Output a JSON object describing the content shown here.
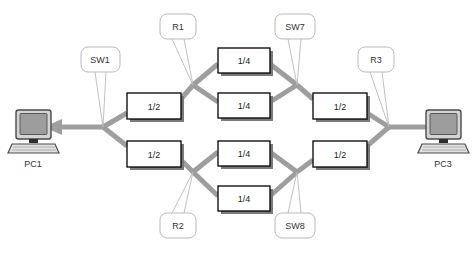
{
  "diagram": {
    "background_color": "#ffffff",
    "link_color": "#9e9e9e",
    "box_border_color": "#000000",
    "box_fill_color": "#ffffff",
    "box_shadow_color": "#7a7a7a",
    "callout_border_color": "#b9b9b9",
    "callout_fill_color": "#ffffff",
    "text_color": "#1a1a1a",
    "endpoints": [
      {
        "id": "pc1",
        "label": "PC1",
        "icon": "desktop-computer-icon",
        "x": 33,
        "y": 127
      },
      {
        "id": "pc3",
        "label": "PC3",
        "icon": "desktop-computer-icon",
        "x": 443,
        "y": 127
      }
    ],
    "boxes": [
      {
        "id": "box-sw1-top",
        "label": "1/2",
        "x": 127,
        "y": 93,
        "w": 54,
        "h": 26
      },
      {
        "id": "box-sw1-bottom",
        "label": "1/2",
        "x": 127,
        "y": 141,
        "w": 54,
        "h": 26
      },
      {
        "id": "box-r1-top",
        "label": "1/4",
        "x": 218,
        "y": 48,
        "w": 52,
        "h": 25
      },
      {
        "id": "box-r1-bottom",
        "label": "1/4",
        "x": 218,
        "y": 93,
        "w": 52,
        "h": 25
      },
      {
        "id": "box-r2-top",
        "label": "1/4",
        "x": 218,
        "y": 141,
        "w": 52,
        "h": 25
      },
      {
        "id": "box-r2-bottom",
        "label": "1/4",
        "x": 218,
        "y": 186,
        "w": 52,
        "h": 25
      },
      {
        "id": "box-sw7",
        "label": "1/2",
        "x": 313,
        "y": 93,
        "w": 54,
        "h": 26
      },
      {
        "id": "box-sw8",
        "label": "1/2",
        "x": 313,
        "y": 141,
        "w": 54,
        "h": 26
      }
    ],
    "callouts": [
      {
        "id": "callout-sw1",
        "label": "SW1",
        "x": 81,
        "y": 47,
        "w": 39,
        "h": 25,
        "tail_from_x": 100,
        "tail_from_y": 72,
        "tail_to_x": 103,
        "tail_to_y": 127
      },
      {
        "id": "callout-r1",
        "label": "R1",
        "x": 160,
        "y": 14,
        "w": 36,
        "h": 25,
        "tail_from_x": 178,
        "tail_from_y": 39,
        "tail_to_x": 193,
        "tail_to_y": 85
      },
      {
        "id": "callout-sw7",
        "label": "SW7",
        "x": 275,
        "y": 14,
        "w": 40,
        "h": 25,
        "tail_from_x": 295,
        "tail_from_y": 39,
        "tail_to_x": 297,
        "tail_to_y": 85
      },
      {
        "id": "callout-r3",
        "label": "R3",
        "x": 358,
        "y": 47,
        "w": 36,
        "h": 25,
        "tail_from_x": 376,
        "tail_from_y": 72,
        "tail_to_x": 389,
        "tail_to_y": 127
      },
      {
        "id": "callout-r2",
        "label": "R2",
        "x": 160,
        "y": 213,
        "w": 36,
        "h": 25,
        "tail_from_x": 178,
        "tail_from_y": 213,
        "tail_to_x": 193,
        "tail_to_y": 172
      },
      {
        "id": "callout-sw8",
        "label": "SW8",
        "x": 275,
        "y": 213,
        "w": 40,
        "h": 25,
        "tail_from_x": 295,
        "tail_from_y": 213,
        "tail_to_x": 297,
        "tail_to_y": 172
      }
    ],
    "junctions": [
      {
        "id": "junction-left",
        "x": 103,
        "y": 127
      },
      {
        "id": "junction-r1",
        "x": 193,
        "y": 85
      },
      {
        "id": "junction-sw7",
        "x": 297,
        "y": 85
      },
      {
        "id": "junction-r2",
        "x": 193,
        "y": 172
      },
      {
        "id": "junction-sw8",
        "x": 297,
        "y": 172
      },
      {
        "id": "junction-right",
        "x": 389,
        "y": 127
      }
    ],
    "links": [
      {
        "id": "link-pc1",
        "from": "pc1",
        "to": "junction-left",
        "arrow": true
      },
      {
        "id": "link-left-up",
        "from": "junction-left",
        "to": "box-sw1-top"
      },
      {
        "id": "link-left-down",
        "from": "junction-left",
        "to": "box-sw1-bottom"
      },
      {
        "id": "link-sw1top-r1",
        "from": "box-sw1-top",
        "to": "junction-r1"
      },
      {
        "id": "link-sw1bot-r2",
        "from": "box-sw1-bottom",
        "to": "junction-r2"
      },
      {
        "id": "link-r1-1a",
        "from": "junction-r1",
        "to": "box-r1-top"
      },
      {
        "id": "link-r1-1b",
        "from": "junction-r1",
        "to": "box-r1-bottom"
      },
      {
        "id": "link-r1top-sw7",
        "from": "box-r1-top",
        "to": "junction-sw7"
      },
      {
        "id": "link-r1bot-sw7",
        "from": "box-r1-bottom",
        "to": "junction-sw7"
      },
      {
        "id": "link-r2-1a",
        "from": "junction-r2",
        "to": "box-r2-top"
      },
      {
        "id": "link-r2-1b",
        "from": "junction-r2",
        "to": "box-r2-bottom"
      },
      {
        "id": "link-r2top-sw8",
        "from": "box-r2-top",
        "to": "junction-sw8"
      },
      {
        "id": "link-r2bot-sw8",
        "from": "box-r2-bottom",
        "to": "junction-sw8"
      },
      {
        "id": "link-sw7-box",
        "from": "junction-sw7",
        "to": "box-sw7"
      },
      {
        "id": "link-sw8-box",
        "from": "junction-sw8",
        "to": "box-sw8"
      },
      {
        "id": "link-sw7box-right",
        "from": "box-sw7",
        "to": "junction-right"
      },
      {
        "id": "link-sw8box-right",
        "from": "box-sw8",
        "to": "junction-right"
      },
      {
        "id": "link-pc3",
        "from": "junction-right",
        "to": "pc3"
      }
    ]
  }
}
